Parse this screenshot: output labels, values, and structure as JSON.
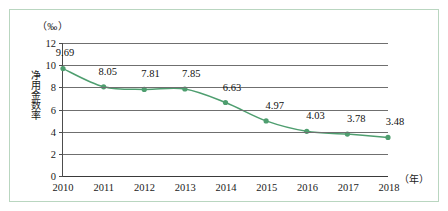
{
  "chart_data": {
    "type": "line",
    "title": "",
    "subtitle": "",
    "unit_label": "（‰）",
    "ylabel": "净用金数率",
    "xlabel": "（年）",
    "categories": [
      "2010",
      "2011",
      "2012",
      "2013",
      "2014",
      "2015",
      "2016",
      "2017",
      "2018"
    ],
    "values": [
      9.69,
      8.05,
      7.81,
      7.85,
      6.63,
      4.97,
      4.03,
      3.78,
      3.48
    ],
    "data_labels": [
      "9.69",
      "8.05",
      "7.81",
      "7.85",
      "6.63",
      "4.97",
      "4.03",
      "3.78",
      "3.48"
    ],
    "ylim": [
      0,
      12
    ],
    "yticks": [
      0,
      2,
      4,
      6,
      8,
      10,
      12
    ],
    "ytick_labels": [
      "0",
      "2",
      "4",
      "6",
      "8",
      "10",
      "12"
    ],
    "grid": true,
    "legend": "none",
    "series": [
      {
        "name": "净用金数率",
        "values": [
          9.69,
          8.05,
          7.81,
          7.85,
          6.63,
          4.97,
          4.03,
          3.78,
          3.48
        ]
      }
    ],
    "colors": {
      "line": "#4e9e6f",
      "marker": "#4e9e6f",
      "grid": "#6f6f6f",
      "axis": "#3a3a3a",
      "frame": "#b9d6c0",
      "text": "#1a1a1a",
      "background": "#ffffff"
    }
  }
}
